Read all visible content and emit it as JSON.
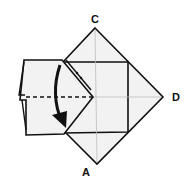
{
  "diagram": {
    "type": "origami-fold-step",
    "labels": {
      "top": "C",
      "right": "D",
      "bottom": "A"
    },
    "instruction_marks": {
      "fold_line": "valley fold (dashed horizontal line)",
      "arrow": "curved arrow pointing down: fold upper flap down",
      "dots": "two dots marking edge alignment"
    },
    "colors": {
      "paper_fill": "#f2f2f2",
      "line": "#111111",
      "crease": "#bdbdbd",
      "background": "#ffffff"
    }
  }
}
